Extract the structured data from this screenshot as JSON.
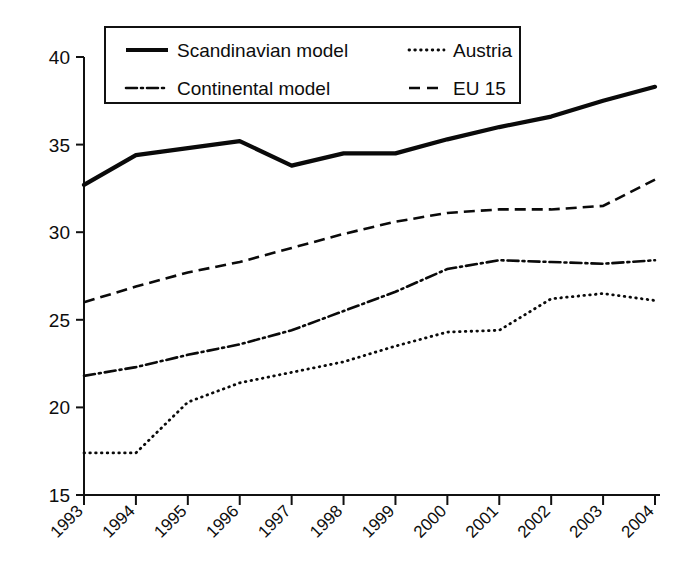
{
  "chart_data": {
    "type": "line",
    "title": "",
    "xlabel": "",
    "ylabel": "",
    "categories": [
      "1993",
      "1994",
      "1995",
      "1996",
      "1997",
      "1998",
      "1999",
      "2000",
      "2001",
      "2002",
      "2003",
      "2004"
    ],
    "ylim": [
      15,
      40
    ],
    "yticks": [
      15,
      20,
      25,
      30,
      35,
      40
    ],
    "ytick_labels": [
      "15",
      "20",
      "25",
      "30",
      "35",
      "40"
    ],
    "grid": false,
    "legend_position": "top-inside",
    "series": [
      {
        "name": "Scandinavian model",
        "style": "solid",
        "values": [
          32.7,
          34.4,
          34.8,
          35.2,
          33.8,
          34.5,
          34.5,
          35.3,
          36.0,
          36.6,
          37.5,
          38.3
        ]
      },
      {
        "name": "Continental model",
        "style": "dash-dot",
        "values": [
          21.8,
          22.3,
          23.0,
          23.6,
          24.4,
          25.5,
          26.6,
          27.9,
          28.4,
          28.3,
          28.2,
          28.4
        ]
      },
      {
        "name": "Austria",
        "style": "dotted",
        "values": [
          17.4,
          17.4,
          20.3,
          21.4,
          22.0,
          22.6,
          23.5,
          24.3,
          24.4,
          26.2,
          26.5,
          26.1
        ]
      },
      {
        "name": "EU 15",
        "style": "dashed",
        "values": [
          26.0,
          26.9,
          27.7,
          28.3,
          29.1,
          29.9,
          30.6,
          31.1,
          31.3,
          31.3,
          31.5,
          33.0
        ]
      }
    ],
    "series_extra_notes": {
      "Continental model": "rises again at 2004 to 30.4 after flat 2001-2003",
      "Austria": "flat 1993-1994 at 17.4, plateau 1999-2001 near 24.4, dips 2003 then jumps 2004 to 30.3"
    }
  },
  "legend": {
    "items": [
      {
        "label": "Scandinavian model",
        "style": "solid"
      },
      {
        "label": "Austria",
        "style": "dotted"
      },
      {
        "label": "Continental model",
        "style": "dash-dot"
      },
      {
        "label": "EU 15",
        "style": "dashed"
      }
    ]
  }
}
